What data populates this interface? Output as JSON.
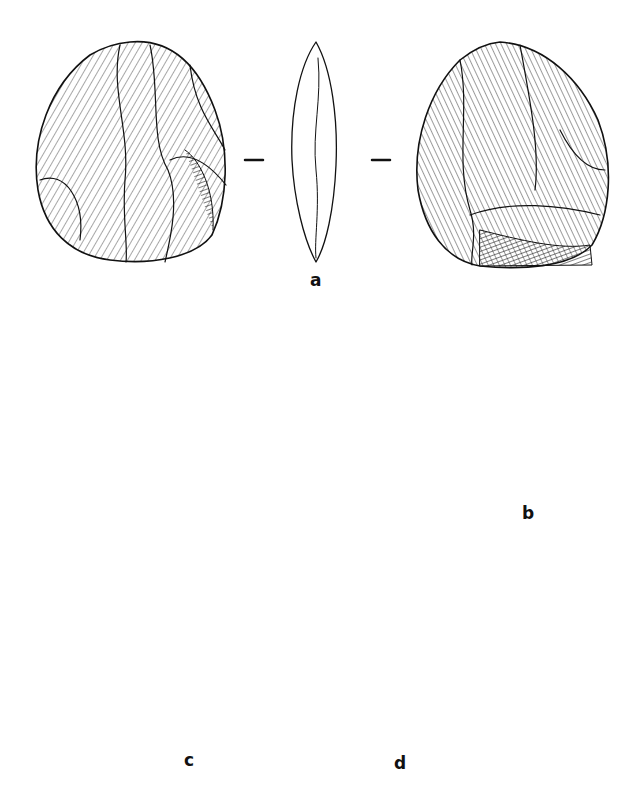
{
  "figure": {
    "type": "lithic-illustration-plate",
    "artifacts": [
      {
        "id": "a",
        "label": "a",
        "views": [
          "face-1",
          "profile",
          "face-2"
        ],
        "section_marks": 2
      },
      {
        "id": "b",
        "label": "b",
        "views": [
          "face",
          "profile"
        ],
        "section_marks": 1
      },
      {
        "id": "c",
        "label": "c",
        "views": [
          "face",
          "profile"
        ],
        "section_marks": 1
      },
      {
        "id": "d",
        "label": "d",
        "views": [
          "profile",
          "face"
        ],
        "section_marks": 1
      }
    ]
  },
  "labels": {
    "a": "a",
    "b": "b",
    "c": "c",
    "d": "d"
  },
  "colors": {
    "ink": "#111111",
    "paper": "#ffffff"
  }
}
